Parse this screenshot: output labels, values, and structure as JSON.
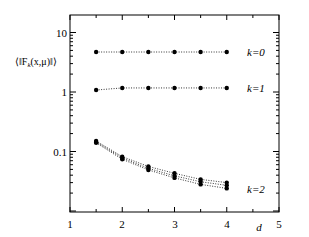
{
  "chart_data": {
    "type": "line",
    "title": "",
    "xlabel": "d",
    "ylabel": "⟨‖F_k(x,μ)‖⟩",
    "xlim": [
      1,
      5
    ],
    "ylim": [
      0.015,
      20
    ],
    "yscale": "log",
    "grid": false,
    "legend": "inline labels at right end of each curve",
    "x_ticks": [
      "1",
      "2",
      "3",
      "4",
      "5"
    ],
    "y_ticks": [
      "0.1",
      "1",
      "10"
    ],
    "x": [
      1.5,
      2,
      2.5,
      3,
      3.5,
      4
    ],
    "series": [
      {
        "name": "k=0",
        "values": [
          4.7,
          4.7,
          4.7,
          4.7,
          4.7,
          4.7
        ]
      },
      {
        "name": "k=1",
        "values": [
          1.08,
          1.17,
          1.17,
          1.17,
          1.17,
          1.17
        ]
      },
      {
        "name": "k=2 (a)",
        "values": [
          0.15,
          0.082,
          0.056,
          0.043,
          0.034,
          0.03
        ]
      },
      {
        "name": "k=2 (b)",
        "values": [
          0.145,
          0.078,
          0.052,
          0.039,
          0.031,
          0.027
        ]
      },
      {
        "name": "k=2 (c)",
        "values": [
          0.14,
          0.074,
          0.049,
          0.036,
          0.028,
          0.024
        ]
      }
    ],
    "annotations": [
      "k=0",
      "k=1",
      "k=2"
    ]
  },
  "labels": {
    "xlabel": "d",
    "ylabel": "⟨‖F",
    "ylabel_sub": "k",
    "ylabel_tail": "(x,μ)‖⟩",
    "k0": "k=0",
    "k1": "k=1",
    "k2": "k=2",
    "xt1": "1",
    "xt2": "2",
    "xt3": "3",
    "xt4": "4",
    "xt5": "5",
    "yt10": "10",
    "yt1": "1",
    "yt01": "0.1"
  }
}
